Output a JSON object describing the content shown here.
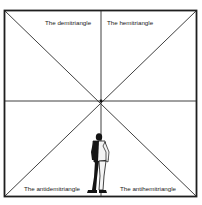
{
  "diagram": {
    "regions": [
      {
        "id": "top-left",
        "label": "The demitriangle"
      },
      {
        "id": "top-right",
        "label": "The hemitriangle"
      },
      {
        "id": "bottom-left",
        "label": "The antidemitriangle"
      },
      {
        "id": "bottom-right",
        "label": "The antihemitriangle"
      }
    ],
    "figure": "standing-man",
    "colors": {
      "line": "#2a2a2a",
      "frame": "#1e1e1e",
      "figure_dark": "#141414",
      "figure_light": "#f4f4f4"
    }
  }
}
